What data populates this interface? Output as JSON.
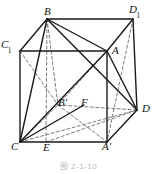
{
  "figure": {
    "caption": "图 2-1-10",
    "shape_name": "cube-solid",
    "stroke_color": "#1a1a1a",
    "dashed_color": "#6b6b6b",
    "background_color": "#ffffff"
  },
  "labels": {
    "B": {
      "text": "B",
      "sub": "",
      "x": 44,
      "y": 6
    },
    "D1": {
      "text": "D",
      "sub": "1",
      "x": 129,
      "y": 4
    },
    "C1": {
      "text": "C",
      "sub": "1",
      "x": 1,
      "y": 39
    },
    "A": {
      "text": "A",
      "sub": "",
      "x": 112,
      "y": 45
    },
    "Bp": {
      "text": "B′",
      "sub": "",
      "x": 58,
      "y": 97
    },
    "F": {
      "text": "F",
      "sub": "",
      "x": 81,
      "y": 97
    },
    "D": {
      "text": "D",
      "sub": "",
      "x": 142,
      "y": 103
    },
    "C": {
      "text": "C",
      "sub": "",
      "x": 11,
      "y": 141
    },
    "E": {
      "text": "E",
      "sub": "",
      "x": 43,
      "y": 142
    },
    "Ap": {
      "text": "A′",
      "sub": "",
      "x": 102,
      "y": 141
    }
  },
  "vertices": {
    "B": {
      "x": 47,
      "y": 19
    },
    "D1": {
      "x": 133,
      "y": 19
    },
    "C1": {
      "x": 20,
      "y": 51
    },
    "A": {
      "x": 107,
      "y": 51
    },
    "Bp": {
      "x": 58,
      "y": 105
    },
    "D": {
      "x": 137,
      "y": 110
    },
    "C": {
      "x": 20,
      "y": 142
    },
    "Ap": {
      "x": 107,
      "y": 142
    },
    "E": {
      "x": 46,
      "y": 142
    },
    "F": {
      "x": 84,
      "y": 105
    }
  },
  "edges": {
    "solid": [
      {
        "name": "edge-B-D1",
        "from": "B",
        "to": "D1"
      },
      {
        "name": "edge-B-C1",
        "from": "B",
        "to": "C1"
      },
      {
        "name": "edge-C1-A",
        "from": "C1",
        "to": "A"
      },
      {
        "name": "edge-A-D1",
        "from": "A",
        "to": "D1"
      },
      {
        "name": "edge-C1-C",
        "from": "C1",
        "to": "C"
      },
      {
        "name": "edge-A-Ap",
        "from": "A",
        "to": "Ap"
      },
      {
        "name": "edge-D1-D",
        "from": "D1",
        "to": "D"
      },
      {
        "name": "edge-C-Ap",
        "from": "C",
        "to": "Ap"
      },
      {
        "name": "edge-Ap-D",
        "from": "Ap",
        "to": "D"
      },
      {
        "name": "diag-B-A",
        "from": "B",
        "to": "A"
      },
      {
        "name": "diag-B-D",
        "from": "B",
        "to": "D"
      },
      {
        "name": "diag-B-C",
        "from": "B",
        "to": "C"
      },
      {
        "name": "diag-A-C",
        "from": "A",
        "to": "C"
      },
      {
        "name": "diag-A-D",
        "from": "A",
        "to": "D"
      },
      {
        "name": "diag-C-F",
        "from": "C",
        "to": "F"
      }
    ],
    "dashed": [
      {
        "name": "hidden-edge-C-Bp",
        "from": "C",
        "to": "Bp"
      },
      {
        "name": "hidden-edge-Bp-D",
        "from": "Bp",
        "to": "D"
      },
      {
        "name": "hidden-edge-B-Bp",
        "from": "B",
        "to": "Bp"
      },
      {
        "name": "hidden-diag-C1-Bp",
        "from": "C1",
        "to": "Bp"
      },
      {
        "name": "hidden-diag-B-E",
        "from": "B",
        "to": "E"
      },
      {
        "name": "hidden-diag-C-D",
        "from": "C",
        "to": "D"
      },
      {
        "name": "hidden-diag-E-D",
        "from": "E",
        "to": "D"
      },
      {
        "name": "hidden-diag-Bp-Ap",
        "from": "Bp",
        "to": "Ap"
      },
      {
        "name": "hidden-diag-A-Bp",
        "from": "A",
        "to": "Bp"
      },
      {
        "name": "hidden-diag-D1-A",
        "from": "D1",
        "to": "Ap"
      }
    ]
  }
}
